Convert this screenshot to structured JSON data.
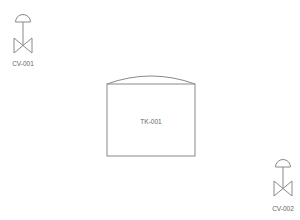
{
  "diagram": {
    "type": "P&ID",
    "colors": {
      "stroke": "#8a8a8a",
      "label": "#666666",
      "background": "#ffffff"
    },
    "equipment": [
      {
        "id": "TK-001",
        "kind": "tank",
        "label": "TK-001"
      }
    ],
    "valves": [
      {
        "id": "CV-001",
        "kind": "control-valve",
        "label": "CV-001"
      },
      {
        "id": "CV-002",
        "kind": "control-valve",
        "label": "CV-002"
      }
    ]
  }
}
